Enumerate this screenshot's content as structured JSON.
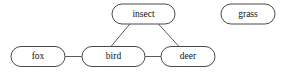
{
  "diagram": {
    "background_color": "#ffffff",
    "node_fill_color": "#ffffff",
    "node_stroke_color": "#4a4a4a",
    "edge_stroke_color": "#5a5a5a",
    "label_color": "#111111",
    "nodes": [
      {
        "id": "insect",
        "label": "insect",
        "cx": 143.5,
        "cy": 14,
        "rx": 31.5,
        "ry": 10
      },
      {
        "id": "grass",
        "label": "grass",
        "cx": 248,
        "cy": 14,
        "rx": 27,
        "ry": 10
      },
      {
        "id": "fox",
        "label": "fox",
        "cx": 38,
        "cy": 56.5,
        "rx": 27,
        "ry": 10
      },
      {
        "id": "bird",
        "label": "bird",
        "cx": 113.5,
        "cy": 56.5,
        "rx": 31.5,
        "ry": 10
      },
      {
        "id": "deer",
        "label": "deer",
        "cx": 188,
        "cy": 56.5,
        "rx": 27,
        "ry": 10
      }
    ],
    "edges": [
      {
        "id": "fox-bird",
        "source": "fox",
        "target": "bird",
        "x1": 65,
        "y1": 56.5,
        "x2": 82,
        "y2": 56.5
      },
      {
        "id": "bird-deer",
        "source": "bird",
        "target": "deer",
        "x1": 145,
        "y1": 56.5,
        "x2": 161,
        "y2": 56.5
      },
      {
        "id": "insect-bird",
        "source": "insect",
        "target": "bird",
        "x1": 131,
        "y1": 22.5,
        "x2": 111,
        "y2": 46.5
      },
      {
        "id": "insect-deer",
        "source": "insect",
        "target": "deer",
        "x1": 157,
        "y1": 22.5,
        "x2": 179,
        "y2": 46.5
      }
    ]
  }
}
